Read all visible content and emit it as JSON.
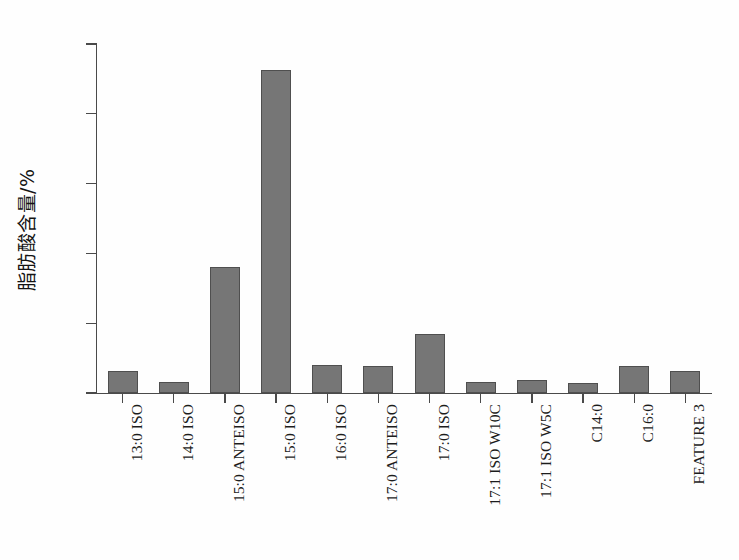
{
  "chart_data": {
    "type": "bar",
    "title": "",
    "xlabel": "",
    "ylabel": "脂肪酸含量/%",
    "ylim": [
      0,
      50
    ],
    "yticks": [
      0,
      10,
      20,
      30,
      40,
      50
    ],
    "ytick_labels": [
      "0",
      "10",
      "20",
      "30",
      "40",
      "50"
    ],
    "grid": false,
    "legend": false,
    "bar_color": "#767676",
    "bar_edge_color": "#4f4f4f",
    "axis_color": "#4a4a4a",
    "background_color": "#fefefe",
    "categories": [
      "13:0 ISO",
      "14:0 ISO",
      "15:0 ANTEISO",
      "15:0 ISO",
      "16:0 ISO",
      "17:0 ANTEISO",
      "17:0 ISO",
      "17:1 ISO W10C",
      "17:1 ISO W5C",
      "C14:0",
      "C16:0",
      "FEATURE 3"
    ],
    "values": [
      3.2,
      1.6,
      18.0,
      46.3,
      4.0,
      3.8,
      8.4,
      1.6,
      1.9,
      1.5,
      3.8,
      3.2
    ]
  }
}
